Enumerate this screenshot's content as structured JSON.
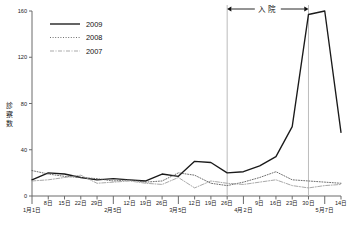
{
  "chart_data": {
    "type": "line",
    "title": "",
    "xlabel": "",
    "ylabel": "診察数",
    "ylim": [
      0,
      160
    ],
    "yticks": [
      0,
      40,
      80,
      120,
      160
    ],
    "grid": false,
    "legend_position": "top-left",
    "x_major_ticks": [
      "1月1日",
      "2月5日",
      "3月5日",
      "4月2日",
      "5月7日"
    ],
    "x": [
      "1月1日",
      "8日",
      "15日",
      "22日",
      "29日",
      "2月5日",
      "12日",
      "19日",
      "26日",
      "3月5日",
      "12日",
      "19日",
      "26日",
      "4月2日",
      "9日",
      "16日",
      "23日",
      "30日",
      "5月7日",
      "14日"
    ],
    "tick_labels": [
      "1月1日",
      "8日",
      "15日",
      "22日",
      "29日",
      "2月5日",
      "12日",
      "19日",
      "26日",
      "3月5日",
      "12日",
      "19日",
      "26日",
      "4月2日",
      "9日",
      "16日",
      "23日",
      "30日",
      "5月7日",
      "14日"
    ],
    "series": [
      {
        "name": "2009",
        "style": "solid",
        "color": "#1a1a1a",
        "values": [
          14,
          20,
          19,
          16,
          14,
          15,
          14,
          13,
          19,
          17,
          30,
          29,
          20,
          21,
          26,
          34,
          60,
          157,
          160,
          55
        ]
      },
      {
        "name": "2008",
        "style": "dotted",
        "color": "#555555",
        "values": [
          22,
          19,
          17,
          16,
          15,
          13,
          14,
          12,
          13,
          20,
          18,
          11,
          9,
          12,
          16,
          21,
          14,
          13,
          12,
          11
        ]
      },
      {
        "name": "2007",
        "style": "dashdot",
        "color": "#9a9a9a",
        "values": [
          13,
          14,
          16,
          18,
          11,
          12,
          13,
          11,
          10,
          16,
          7,
          13,
          11,
          10,
          12,
          14,
          9,
          7,
          9,
          10
        ]
      }
    ],
    "annotations": [
      {
        "label": "入院",
        "type": "span-arrow",
        "from": "3月26日",
        "to": "4月30日"
      }
    ],
    "vertical_markers": [
      "3月26日",
      "4月30日"
    ]
  },
  "legend": {
    "items": [
      {
        "label": "2009"
      },
      {
        "label": "2008"
      },
      {
        "label": "2007"
      }
    ]
  },
  "axis": {
    "y_title": "診察数",
    "y_title_chars": [
      "診",
      "察",
      "数"
    ]
  }
}
